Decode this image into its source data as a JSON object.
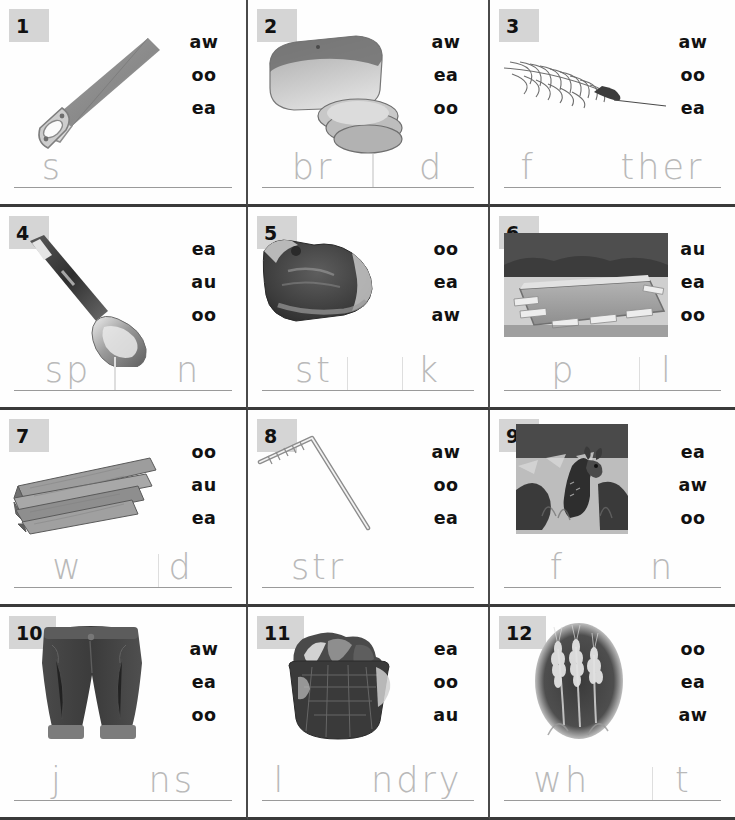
{
  "worksheet": {
    "title": "Vowel Teams Picture Worksheet",
    "columns": 3,
    "rows": 4,
    "option_count": 3
  },
  "cells": [
    {
      "number": "1",
      "image_name": "saw-photo",
      "image_alt": "handsaw",
      "options": [
        "aw",
        "oo",
        "ea"
      ],
      "answer_prompt": "s          ",
      "answer_word": "saw"
    },
    {
      "number": "2",
      "image_name": "bread-photo",
      "image_alt": "loaf of sliced bread",
      "options": [
        "aw",
        "ea",
        "oo"
      ],
      "answer_prompt": "br      d",
      "answer_word": "bread"
    },
    {
      "number": "3",
      "image_name": "feather-photo",
      "image_alt": "feather",
      "options": [
        "aw",
        "oo",
        "ea"
      ],
      "answer_prompt": "f      ther",
      "answer_word": "feather"
    },
    {
      "number": "4",
      "image_name": "spoon-photo",
      "image_alt": "spoon",
      "options": [
        "ea",
        "au",
        "oo"
      ],
      "answer_prompt": "sp      n",
      "answer_word": "spoon"
    },
    {
      "number": "5",
      "image_name": "steak-photo",
      "image_alt": "steak",
      "options": [
        "oo",
        "ea",
        "aw"
      ],
      "answer_prompt": "st      k",
      "answer_word": "steak"
    },
    {
      "number": "6",
      "image_name": "pool-photo",
      "image_alt": "swimming pool",
      "options": [
        "au",
        "ea",
        "oo"
      ],
      "answer_prompt": "p      l",
      "answer_word": "pool"
    },
    {
      "number": "7",
      "image_name": "wood-photo",
      "image_alt": "stack of wood planks",
      "options": [
        "oo",
        "au",
        "ea"
      ],
      "answer_prompt": "w      d",
      "answer_word": "wood"
    },
    {
      "number": "8",
      "image_name": "straw-photo",
      "image_alt": "bendy drinking straw",
      "options": [
        "aw",
        "oo",
        "ea"
      ],
      "answer_prompt": "str       ",
      "answer_word": "straw"
    },
    {
      "number": "9",
      "image_name": "fawn-photo",
      "image_alt": "fawn deer",
      "options": [
        "ea",
        "aw",
        "oo"
      ],
      "answer_prompt": "f      n",
      "answer_word": "fawn"
    },
    {
      "number": "10",
      "image_name": "jeans-photo",
      "image_alt": "blue jeans",
      "options": [
        "aw",
        "ea",
        "oo"
      ],
      "answer_prompt": "j      ns",
      "answer_word": "jeans"
    },
    {
      "number": "11",
      "image_name": "laundry-photo",
      "image_alt": "laundry basket",
      "options": [
        "ea",
        "oo",
        "au"
      ],
      "answer_prompt": "l      ndry",
      "answer_word": "laundry"
    },
    {
      "number": "12",
      "image_name": "wheat-photo",
      "image_alt": "wheat stalks",
      "options": [
        "oo",
        "ea",
        "aw"
      ],
      "answer_prompt": "wh      t",
      "answer_word": "wheat"
    }
  ],
  "colors": {
    "number_box": "#d5d5d5",
    "grid_line": "#3a3a3a",
    "answer_line": "#9a9a9a",
    "traced_text": "#b9b9b9",
    "option_text": "#111111"
  }
}
